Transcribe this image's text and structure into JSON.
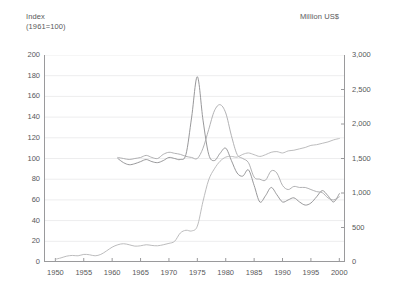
{
  "chart_data": {
    "type": "line",
    "title": "",
    "xlabel": "",
    "left_axis_title": "Index\n(1961=100)",
    "right_axis_title": "Million US$",
    "grid": true,
    "legend": "none",
    "xlim": [
      1948,
      2001
    ],
    "xticks": [
      "1950",
      "1955",
      "1960",
      "1965",
      "1970",
      "1975",
      "1980",
      "1985",
      "1990",
      "1995",
      "2000"
    ],
    "xtick_values": [
      1950,
      1955,
      1960,
      1965,
      1970,
      1975,
      1980,
      1985,
      1990,
      1995,
      2000
    ],
    "ylim_left": [
      0,
      200
    ],
    "yticks_left": [
      "0",
      "20",
      "40",
      "60",
      "80",
      "100",
      "120",
      "140",
      "160",
      "180",
      "200"
    ],
    "ytick_values_left": [
      0,
      20,
      40,
      60,
      80,
      100,
      120,
      140,
      160,
      180,
      200
    ],
    "ylim_right": [
      0,
      3000
    ],
    "yticks_right": [
      "0",
      "500",
      "1,000",
      "1,500",
      "2,000",
      "2,500",
      "3,000"
    ],
    "ytick_values_right": [
      0,
      500,
      1000,
      1500,
      2000,
      2500,
      3000
    ],
    "colors": {
      "series1": "#8c8c8e",
      "series2": "#a8a8aa",
      "series3": "#b4b4b6",
      "grid": "#ededee",
      "axis": "#9a9a9c",
      "text": "#58585a",
      "background": "#ffffff"
    },
    "series": [
      {
        "name": "index-series-dark",
        "axis": "left",
        "color": "#8c8c8e",
        "x": [
          1961,
          1962,
          1963,
          1964,
          1965,
          1966,
          1967,
          1968,
          1969,
          1970,
          1971,
          1972,
          1973,
          1974,
          1975,
          1976,
          1977,
          1978,
          1979,
          1980,
          1981,
          1982,
          1983,
          1984,
          1985,
          1986,
          1987,
          1988,
          1989,
          1990,
          1991,
          1992,
          1993,
          1994,
          1995,
          1996,
          1997,
          1998,
          1999,
          2000
        ],
        "values": [
          100,
          96,
          94,
          95,
          97,
          99,
          97,
          96,
          98,
          101,
          100,
          99,
          104,
          140,
          179,
          137,
          104,
          98,
          105,
          110,
          98,
          86,
          83,
          89,
          74,
          58,
          64,
          72,
          65,
          58,
          60,
          62,
          58,
          55,
          57,
          63,
          69,
          64,
          58,
          66
        ]
      },
      {
        "name": "index-series-mid",
        "axis": "left",
        "color": "#a8a8aa",
        "x": [
          1961,
          1962,
          1963,
          1964,
          1965,
          1966,
          1967,
          1968,
          1969,
          1970,
          1971,
          1972,
          1973,
          1974,
          1975,
          1976,
          1977,
          1978,
          1979,
          1980,
          1981,
          1982,
          1983,
          1984,
          1985,
          1986,
          1987,
          1988,
          1989,
          1990,
          1991,
          1992,
          1993,
          1994,
          1995,
          1996,
          1997,
          1998,
          1999,
          2000
        ],
        "values": [
          101,
          100,
          99,
          100,
          101,
          103,
          101,
          100,
          104,
          106,
          105,
          104,
          102,
          101,
          100,
          110,
          128,
          146,
          152,
          144,
          122,
          104,
          100,
          96,
          82,
          80,
          79,
          88,
          86,
          74,
          70,
          73,
          72,
          72,
          70,
          68,
          67,
          62,
          60,
          63
        ]
      },
      {
        "name": "value-series-million-usd",
        "axis": "right",
        "color": "#b4b4b6",
        "x": [
          1950,
          1951,
          1952,
          1953,
          1954,
          1955,
          1956,
          1957,
          1958,
          1959,
          1960,
          1961,
          1962,
          1963,
          1964,
          1965,
          1966,
          1967,
          1968,
          1969,
          1970,
          1971,
          1972,
          1973,
          1974,
          1975,
          1976,
          1977,
          1978,
          1979,
          1980,
          1981,
          1982,
          1983,
          1984,
          1985,
          1986,
          1987,
          1988,
          1989,
          1990,
          1991,
          1992,
          1993,
          1994,
          1995,
          1996,
          1997,
          1998,
          1999,
          2000
        ],
        "values": [
          40,
          60,
          85,
          95,
          90,
          110,
          105,
          90,
          110,
          160,
          215,
          250,
          265,
          250,
          230,
          235,
          250,
          240,
          235,
          250,
          270,
          300,
          420,
          460,
          450,
          520,
          880,
          1190,
          1350,
          1460,
          1520,
          1530,
          1520,
          1560,
          1580,
          1555,
          1530,
          1555,
          1590,
          1600,
          1580,
          1610,
          1620,
          1640,
          1660,
          1690,
          1700,
          1720,
          1740,
          1770,
          1790
        ]
      }
    ]
  }
}
